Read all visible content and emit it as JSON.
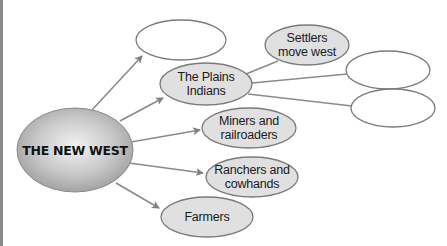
{
  "diagram": {
    "type": "cluster-web",
    "center": {
      "label": "THE NEW WEST"
    },
    "nodes": [
      {
        "id": "blank-top",
        "label": ""
      },
      {
        "id": "plains-indians",
        "label": "The Plains\nIndians"
      },
      {
        "id": "settlers",
        "label": "Settlers\nmove west"
      },
      {
        "id": "blank-right-1",
        "label": ""
      },
      {
        "id": "blank-right-2",
        "label": ""
      },
      {
        "id": "miners",
        "label": "Miners and\nrailroaders"
      },
      {
        "id": "ranchers",
        "label": "Ranchers and\ncowhands"
      },
      {
        "id": "farmers",
        "label": "Farmers"
      }
    ],
    "colors": {
      "center_fill": "#bdbdbd",
      "filled_node": "#e0e0e0",
      "empty_node": "#ffffff",
      "stroke": "#7a7a7a",
      "arrow": "#7f7f7f"
    }
  }
}
